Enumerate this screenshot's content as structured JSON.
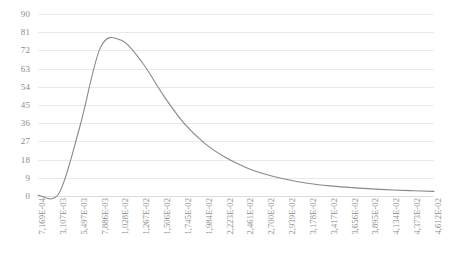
{
  "chart_data": {
    "type": "line",
    "title": "",
    "subtitle": "",
    "xlabel": "",
    "ylabel": "",
    "grid": true,
    "legend": false,
    "legend_position": "none",
    "line_color": "#888888",
    "grid_color": "#e9e9e9",
    "axis_label_color": "#8c8c8c",
    "background_color": "#ffffff",
    "ylim": [
      0,
      90
    ],
    "y_ticks": [
      0,
      9,
      18,
      27,
      36,
      45,
      54,
      63,
      72,
      81,
      90
    ],
    "x_tick_labels": [
      "7,169E-04",
      "3,107E-03",
      "5,497E-03",
      "7,886E-03",
      "1,028E-02",
      "1,267E-02",
      "1,506E-02",
      "1,745E-02",
      "1,984E-02",
      "2,223E-02",
      "2,461E-02",
      "2,700E-02",
      "2,939E-02",
      "3,178E-02",
      "3,417E-02",
      "3,656E-02",
      "3,895E-02",
      "4,134E-02",
      "4,373E-02",
      "4,612E-02"
    ],
    "x": [
      0.0007169,
      0.003107,
      0.005497,
      0.007886,
      0.01028,
      0.01267,
      0.01506,
      0.01745,
      0.01984,
      0.02223,
      0.02461,
      0.027,
      0.02939,
      0.03178,
      0.03417,
      0.03656,
      0.03895,
      0.04134,
      0.04373,
      0.04612
    ],
    "values": [
      0.4,
      1.2,
      34.0,
      73.5,
      77.0,
      66.0,
      50.0,
      36.0,
      26.0,
      19.0,
      14.0,
      10.5,
      8.0,
      6.2,
      5.0,
      4.2,
      3.5,
      3.0,
      2.6,
      2.3
    ],
    "series": [
      {
        "name": "distribution",
        "values": [
          0.4,
          1.2,
          34.0,
          73.5,
          77.0,
          66.0,
          50.0,
          36.0,
          26.0,
          19.0,
          14.0,
          10.5,
          8.0,
          6.2,
          5.0,
          4.2,
          3.5,
          3.0,
          2.6,
          2.3
        ]
      }
    ],
    "peak": {
      "x_index": 4,
      "value": 77.0
    },
    "annotations": []
  }
}
